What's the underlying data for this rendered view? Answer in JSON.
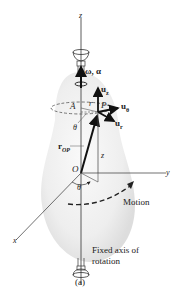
{
  "figure": {
    "caption": "(a)",
    "axes": {
      "z": "z",
      "y": "y",
      "x": "x"
    },
    "labels": {
      "omega_alpha": "ω, α",
      "u_z": "u",
      "u_z_sub": "z",
      "u_theta": "u",
      "u_theta_sub": "θ",
      "u_r": "u",
      "u_r_sub": "r",
      "point_A": "A",
      "point_P": "P",
      "r": "r",
      "theta_upper": "θ",
      "theta_lower": "θ",
      "r_OP": "r",
      "r_OP_sub": "OP",
      "z_height": "z",
      "origin": "O",
      "motion": "Motion",
      "fixed_axis_line1": "Fixed axis of",
      "fixed_axis_line2": "rotation"
    },
    "colors": {
      "body_fill": "#ececec",
      "line": "#333333",
      "vector": "#111111"
    }
  }
}
